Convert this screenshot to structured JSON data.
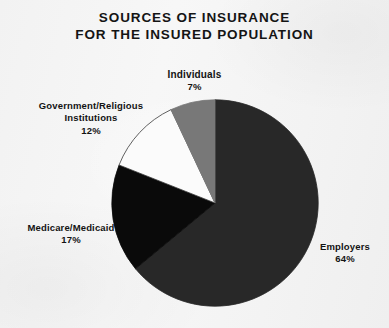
{
  "chart_data": {
    "type": "pie",
    "title": "SOURCES OF INSURANCE FOR THE INSURED POPULATION",
    "title_lines": [
      "SOURCES OF INSURANCE",
      "FOR THE INSURED POPULATION"
    ],
    "xlabel": "",
    "ylabel": "",
    "grid": false,
    "legend_position": "callout-labels",
    "units": "percent",
    "start_angle_deg": 0,
    "direction": "clockwise",
    "categories": [
      "Employers",
      "Medicare/Medicaid",
      "Government/Religious Institutions",
      "Individuals"
    ],
    "values": [
      64,
      17,
      12,
      7
    ],
    "slices": [
      {
        "label": "Employers",
        "label_lines": [
          "Employers"
        ],
        "value": 64,
        "value_text": "64%",
        "color": "#282828",
        "outline": "#282828"
      },
      {
        "label": "Medicare/Medicaid",
        "label_lines": [
          "Medicare/Medicaid"
        ],
        "value": 17,
        "value_text": "17%",
        "color": "#0a0a0a",
        "outline": "#0a0a0a"
      },
      {
        "label": "Government/Religious Institutions",
        "label_lines": [
          "Government/Religious",
          "Institutions"
        ],
        "value": 12,
        "value_text": "12%",
        "color": "#fbfbfb",
        "outline": "#3a3a3a"
      },
      {
        "label": "Individuals",
        "label_lines": [
          "Individuals"
        ],
        "value": 7,
        "value_text": "7%",
        "color": "#787878",
        "outline": "#787878"
      }
    ]
  },
  "colors": {
    "background": "#f5f5f5",
    "text": "#131313",
    "employers": "#282828",
    "medicare": "#0a0a0a",
    "government": "#fbfbfb",
    "individuals": "#787878"
  }
}
